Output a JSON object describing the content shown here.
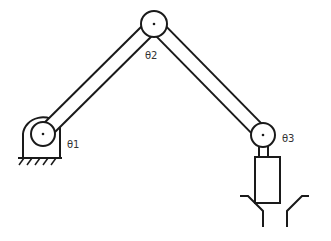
{
  "diagram": {
    "title": "",
    "joints": [
      {
        "id": "j1",
        "label": "θ1",
        "cx": 43,
        "cy": 134,
        "r": 12
      },
      {
        "id": "j2",
        "label": "θ2",
        "cx": 154,
        "cy": 24,
        "r": 13
      },
      {
        "id": "j3",
        "label": "θ3",
        "cx": 263,
        "cy": 135,
        "r": 12
      }
    ],
    "colors": {
      "stroke": "#1a1a1a",
      "fill": "#ffffff",
      "label": "#333333"
    }
  }
}
